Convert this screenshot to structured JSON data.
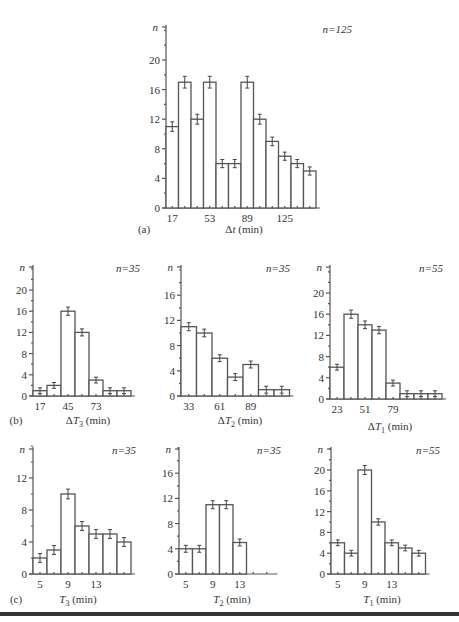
{
  "figure": {
    "panels": [
      {
        "id": "a",
        "label": "(a)",
        "n_text": "n = 125",
        "xlabel_symbol": "Δt",
        "xlabel_unit": "(min)"
      },
      {
        "id": "b1",
        "label": "(b)",
        "n_text": "n = 35",
        "xlabel_symbol": "ΔT3",
        "xlabel_unit": "(min)"
      },
      {
        "id": "b2",
        "label": "",
        "n_text": "n = 35",
        "xlabel_symbol": "ΔT2",
        "xlabel_unit": "(min)"
      },
      {
        "id": "b3",
        "label": "",
        "n_text": "n = 55",
        "xlabel_symbol": "ΔT1",
        "xlabel_unit": "(min)"
      },
      {
        "id": "c1",
        "label": "(c)",
        "n_text": "n = 35",
        "xlabel_symbol": "T3",
        "xlabel_unit": "(min)"
      },
      {
        "id": "c2",
        "label": "",
        "n_text": "n = 35",
        "xlabel_symbol": "T2",
        "xlabel_unit": "(min)"
      },
      {
        "id": "c3",
        "label": "",
        "n_text": "n = 55",
        "xlabel_symbol": "T1",
        "xlabel_unit": "(min)"
      }
    ]
  },
  "chart_data": [
    {
      "id": "a",
      "type": "bar",
      "title": "",
      "panel": "(a)",
      "annotation": "n = 125",
      "xlabel": "Δt (min)",
      "ylabel": "n",
      "x_tick_labels": [
        "17",
        "53",
        "89",
        "125"
      ],
      "bin_width": 9,
      "bin_start": 17,
      "values": [
        11,
        17,
        12,
        17,
        6,
        6,
        17,
        12,
        9,
        7,
        6,
        5
      ],
      "y_ticks": [
        0,
        4,
        8,
        12,
        16,
        20
      ],
      "ylim": [
        0,
        24
      ],
      "error_bars": true,
      "grid": false
    },
    {
      "id": "b1",
      "type": "bar",
      "panel": "(b)",
      "annotation": "n = 35",
      "xlabel": "ΔT3 (min)",
      "ylabel": "n",
      "x_tick_labels": [
        "17",
        "45",
        "73"
      ],
      "bin_width": 14,
      "bin_start": 17,
      "values": [
        1,
        2,
        16,
        12,
        3,
        1,
        1
      ],
      "y_ticks": [
        0,
        4,
        8,
        12,
        16,
        20
      ],
      "ylim": [
        0,
        24
      ],
      "error_bars": true,
      "grid": false
    },
    {
      "id": "b2",
      "type": "bar",
      "panel": "",
      "annotation": "n = 35",
      "xlabel": "ΔT2 (min)",
      "ylabel": "n",
      "x_tick_labels": [
        "33",
        "61",
        "89"
      ],
      "bin_width": 14,
      "bin_start": 33,
      "values": [
        11,
        10,
        6,
        3,
        5,
        1,
        1
      ],
      "y_ticks": [
        0,
        4,
        8,
        12,
        16
      ],
      "ylim": [
        0,
        20
      ],
      "error_bars": true,
      "grid": false
    },
    {
      "id": "b3",
      "type": "bar",
      "panel": "",
      "annotation": "n = 55",
      "xlabel": "ΔT1 (min)",
      "ylabel": "n",
      "x_tick_labels": [
        "23",
        "51",
        "79"
      ],
      "bin_width": 14,
      "bin_start": 23,
      "values": [
        6,
        16,
        14,
        13,
        3,
        1,
        1,
        1
      ],
      "y_ticks": [
        0,
        4,
        8,
        12,
        16,
        20
      ],
      "ylim": [
        0,
        24
      ],
      "error_bars": true,
      "grid": false
    },
    {
      "id": "c1",
      "type": "bar",
      "panel": "(c)",
      "annotation": "n = 35",
      "xlabel": "T3 (min)",
      "ylabel": "n",
      "x_tick_labels": [
        "5",
        "9",
        "13"
      ],
      "bin_width": 2,
      "bin_start": 5,
      "values": [
        2,
        3,
        10,
        6,
        5,
        5,
        4
      ],
      "y_ticks": [
        0,
        4,
        8,
        12
      ],
      "ylim": [
        0,
        16
      ],
      "error_bars": true,
      "grid": false
    },
    {
      "id": "c2",
      "type": "bar",
      "panel": "",
      "annotation": "n = 35",
      "xlabel": "T2 (min)",
      "ylabel": "n",
      "x_tick_labels": [
        "5",
        "9",
        "13"
      ],
      "bin_width": 2,
      "bin_start": 5,
      "values": [
        4,
        4,
        11,
        11,
        5
      ],
      "y_ticks": [
        0,
        4,
        8,
        12,
        16
      ],
      "ylim": [
        0,
        20
      ],
      "error_bars": true,
      "grid": false
    },
    {
      "id": "c3",
      "type": "bar",
      "panel": "",
      "annotation": "n = 55",
      "xlabel": "T1 (min)",
      "ylabel": "n",
      "x_tick_labels": [
        "5",
        "9",
        "13"
      ],
      "bin_width": 2,
      "bin_start": 5,
      "values": [
        6,
        4,
        20,
        10,
        6,
        5,
        4
      ],
      "y_ticks": [
        0,
        4,
        8,
        12,
        16,
        20
      ],
      "ylim": [
        0,
        24
      ],
      "error_bars": true,
      "grid": false
    }
  ],
  "layout": {
    "panels": {
      "a": {
        "x0": 166,
        "base": 208,
        "top": 25,
        "h_unit": 7.4,
        "bar_w": 12.5,
        "n_x": 352,
        "n_y": 33,
        "tick_positions": [
          0,
          3,
          6,
          9
        ],
        "extra_ticks": 12,
        "max_val": 24,
        "panel_label_x": 144,
        "panel_label_y": 233,
        "xlabel_x": 244,
        "xlabel_y": 233
      },
      "b1": {
        "x0": 33,
        "base": 396,
        "top": 265,
        "h_unit": 5.3,
        "bar_w": 14,
        "n_x": 140,
        "n_y": 272,
        "tick_positions": [
          0,
          2,
          4
        ],
        "extra_ticks": 7,
        "max_val": 24,
        "panel_label_x": 16,
        "panel_label_y": 424,
        "xlabel_x": 88,
        "xlabel_y": 424
      },
      "b2": {
        "x0": 181,
        "base": 396,
        "top": 265,
        "h_unit": 6.3,
        "bar_w": 15.5,
        "n_x": 290,
        "n_y": 272,
        "tick_positions": [
          0,
          2,
          4
        ],
        "extra_ticks": 7,
        "max_val": 20,
        "panel_label_x": 0,
        "panel_label_y": 0,
        "xlabel_x": 240,
        "xlabel_y": 424
      },
      "b3": {
        "x0": 330,
        "base": 399,
        "top": 265,
        "h_unit": 5.3,
        "bar_w": 14,
        "n_x": 443,
        "n_y": 272,
        "tick_positions": [
          0,
          2,
          4
        ],
        "extra_ticks": 8,
        "max_val": 24,
        "panel_label_x": 0,
        "panel_label_y": 0,
        "xlabel_x": 390,
        "xlabel_y": 430
      },
      "c1": {
        "x0": 33,
        "base": 574,
        "top": 447,
        "h_unit": 8.0,
        "bar_w": 14,
        "n_x": 136,
        "n_y": 454,
        "tick_positions": [
          0,
          2,
          4
        ],
        "extra_ticks": 7,
        "max_val": 16,
        "panel_label_x": 16,
        "panel_label_y": 603,
        "xlabel_x": 78,
        "xlabel_y": 603
      },
      "c2": {
        "x0": 179,
        "base": 574,
        "top": 447,
        "h_unit": 6.3,
        "bar_w": 13.5,
        "n_x": 281,
        "n_y": 454,
        "tick_positions": [
          0,
          2,
          4
        ],
        "extra_ticks": 7,
        "max_val": 20,
        "panel_label_x": 0,
        "panel_label_y": 0,
        "xlabel_x": 232,
        "xlabel_y": 603
      },
      "c3": {
        "x0": 331,
        "base": 574,
        "top": 447,
        "h_unit": 5.2,
        "bar_w": 13.5,
        "n_x": 440,
        "n_y": 454,
        "tick_positions": [
          0,
          2,
          4
        ],
        "extra_ticks": 7,
        "max_val": 24,
        "panel_label_x": 0,
        "panel_label_y": 0,
        "xlabel_x": 382,
        "xlabel_y": 603
      }
    }
  }
}
